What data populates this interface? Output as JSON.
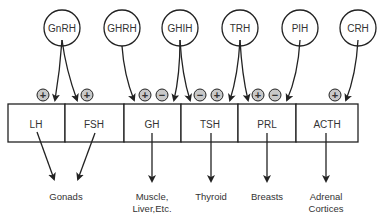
{
  "colors": {
    "stroke": "#222222",
    "sign_fill": "#c8c8c8",
    "text": "#333333"
  },
  "releasing_hormones": [
    {
      "id": "gnrh",
      "label": "GnRH",
      "cx": 62
    },
    {
      "id": "ghrh",
      "label": "GHRH",
      "cx": 122
    },
    {
      "id": "ghih",
      "label": "GHIH",
      "cx": 180
    },
    {
      "id": "trh",
      "label": "TRH",
      "cx": 240
    },
    {
      "id": "pih",
      "label": "PIH",
      "cx": 300
    },
    {
      "id": "crh",
      "label": "CRH",
      "cx": 358
    }
  ],
  "pituitary_hormones": [
    {
      "id": "lh",
      "label": "LH"
    },
    {
      "id": "fsh",
      "label": "FSH"
    },
    {
      "id": "gh",
      "label": "GH"
    },
    {
      "id": "tsh",
      "label": "TSH"
    },
    {
      "id": "prl",
      "label": "PRL"
    },
    {
      "id": "acth",
      "label": "ACTH"
    }
  ],
  "effects": [
    {
      "x": 43,
      "sign": "+"
    },
    {
      "x": 87,
      "sign": "+"
    },
    {
      "x": 145,
      "sign": "+"
    },
    {
      "x": 162,
      "sign": "−"
    },
    {
      "x": 200,
      "sign": "−"
    },
    {
      "x": 217,
      "sign": "+"
    },
    {
      "x": 258,
      "sign": "+"
    },
    {
      "x": 275,
      "sign": "−"
    },
    {
      "x": 335,
      "sign": "+"
    }
  ],
  "targets": [
    {
      "id": "gonads",
      "lines": [
        "Gonads"
      ],
      "x": 66
    },
    {
      "id": "muscle",
      "lines": [
        "Muscle,",
        "Liver,Etc."
      ],
      "x": 152
    },
    {
      "id": "thyroid",
      "lines": [
        "Thyroid"
      ],
      "x": 211
    },
    {
      "id": "breasts",
      "lines": [
        "Breasts"
      ],
      "x": 267
    },
    {
      "id": "adrenal",
      "lines": [
        "Adrenal",
        "Cortices"
      ],
      "x": 326
    }
  ]
}
